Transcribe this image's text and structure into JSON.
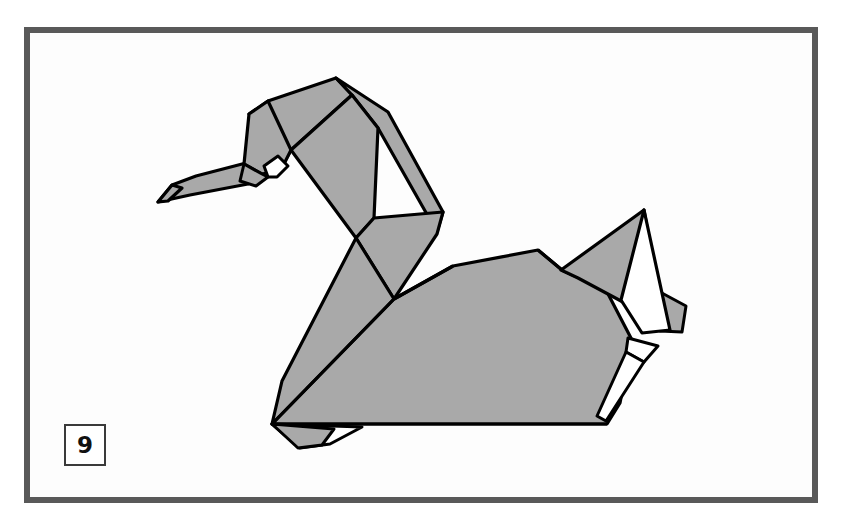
{
  "page": {
    "background_color": "#ffffff",
    "width": 845,
    "height": 523
  },
  "frame": {
    "border_color": "#595959",
    "fill_color": "#fdfdfd",
    "border_width": 6
  },
  "step_badge": {
    "number": "9",
    "border_color": "#3a3a3a",
    "text_color": "#111111",
    "background_color": "#ffffff"
  },
  "figure": {
    "paper_gray": "#a9a9a9",
    "paper_white": "#ffffff",
    "outline_color": "#000000",
    "outline_width": 3,
    "parts": [
      {
        "name": "beak-lower",
        "fill": "#a9a9a9",
        "points": "158,202 172,185 196,176 246,163 262,172 248,184 190,195"
      },
      {
        "name": "beak-upper",
        "fill": "#a9a9a9",
        "points": "246,163 262,153 281,158 276,172 262,172"
      },
      {
        "name": "head-left",
        "fill": "#a9a9a9",
        "points": "249,114 268,101 291,150 281,168 262,172 246,163"
      },
      {
        "name": "head-crown",
        "fill": "#a9a9a9",
        "points": "268,101 336,78 352,95 291,150"
      },
      {
        "name": "head-notch",
        "fill": "#ffffff",
        "points": "262,172 276,158 284,164 276,174"
      },
      {
        "name": "neck-front",
        "fill": "#a9a9a9",
        "points": "291,150 352,95 378,128 374,217 356,236"
      },
      {
        "name": "neck-back",
        "fill": "#a9a9a9",
        "points": "336,78 388,110 443,212 437,232 378,128 352,95"
      },
      {
        "name": "neck-body-column",
        "fill": "#a9a9a9",
        "points": "374,217 443,212 437,232 392,300 356,236"
      },
      {
        "name": "breast",
        "fill": "#a9a9a9",
        "points": "356,236 392,300 310,422 272,423 283,378"
      },
      {
        "name": "body-main",
        "fill": "#a9a9a9",
        "points": "272,423 392,300 453,265 538,249 586,259 632,339 620,401 607,423"
      },
      {
        "name": "wing-upper-edge",
        "fill": "#a9a9a9",
        "points": "538,249 586,259 606,289 561,276"
      },
      {
        "name": "tail-spike-gray",
        "fill": "#a9a9a9",
        "points": "644,210 663,322 577,276 561,270"
      },
      {
        "name": "tail-spike-white",
        "fill": "#ffffff",
        "points": "644,210 668,327 641,331 620,299"
      },
      {
        "name": "tail-flap-right",
        "fill": "#a9a9a9",
        "points": "663,296 684,305 681,330 666,330"
      },
      {
        "name": "tail-notch-white",
        "fill": "#ffffff",
        "points": "630,337 656,345 643,360 628,352"
      },
      {
        "name": "tail-under-sliver",
        "fill": "#ffffff",
        "points": "628,352 643,360 605,420 597,414"
      },
      {
        "name": "foot-front",
        "fill": "#a9a9a9",
        "points": "272,423 330,428 322,444 298,447"
      },
      {
        "name": "foot-rear",
        "fill": "#ffffff",
        "points": "298,447 322,444 340,430 360,428"
      }
    ],
    "fold_lines": [
      "291,150 281,168",
      "352,95 291,150",
      "378,128 374,217",
      "356,236 392,300",
      "392,300 272,423",
      "453,265 392,300",
      "561,270 606,289",
      "586,259 632,339",
      "272,423 607,423"
    ]
  }
}
